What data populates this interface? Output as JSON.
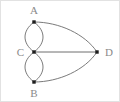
{
  "figure": {
    "kind": "multigraph-diagram",
    "width": 120,
    "height": 102,
    "background_color": "#ffffff",
    "border_color": "#e2e2e2"
  },
  "style": {
    "edge_color": "#6b6b6b",
    "vertex_color": "#1d1d1d",
    "label_color": "#8a8a8a",
    "edge_width": 0.9,
    "vertex_size": 3
  },
  "vertices": [
    {
      "id": "A",
      "label": "A",
      "x": 33,
      "y": 21,
      "label_x": 33,
      "label_y": 13,
      "label_pos": "above"
    },
    {
      "id": "C",
      "label": "C",
      "x": 33,
      "y": 51,
      "label_x": 23,
      "label_y": 55,
      "label_pos": "left"
    },
    {
      "id": "B",
      "label": "B",
      "x": 33,
      "y": 81,
      "label_x": 33,
      "label_y": 96,
      "label_pos": "below"
    },
    {
      "id": "D",
      "label": "D",
      "x": 96,
      "y": 51,
      "label_x": 104,
      "label_y": 55,
      "label_pos": "right"
    }
  ],
  "edges": [
    {
      "id": "A-C-left",
      "from": "A",
      "to": "C",
      "shape": "curve",
      "bulge": "left",
      "path": "M 33 21 C 21 30, 21 42, 33 51"
    },
    {
      "id": "A-C-right",
      "from": "A",
      "to": "C",
      "shape": "curve",
      "bulge": "right",
      "path": "M 33 21 C 45 30, 45 42, 33 51"
    },
    {
      "id": "C-B-left",
      "from": "C",
      "to": "B",
      "shape": "curve",
      "bulge": "left",
      "path": "M 33 51 C 21 60, 21 72, 33 81"
    },
    {
      "id": "C-B-right",
      "from": "C",
      "to": "B",
      "shape": "curve",
      "bulge": "right",
      "path": "M 33 51 C 45 60, 45 72, 33 81"
    },
    {
      "id": "C-D",
      "from": "C",
      "to": "D",
      "shape": "straight",
      "path": "M 33 51 L 96 51"
    },
    {
      "id": "A-D",
      "from": "A",
      "to": "D",
      "shape": "curve",
      "bulge": "up",
      "path": "M 33 21 C 58 21, 84 33, 96 51"
    },
    {
      "id": "B-D",
      "from": "B",
      "to": "D",
      "shape": "curve",
      "bulge": "down",
      "path": "M 33 81 C 58 81, 84 69, 96 51"
    }
  ],
  "summary": {
    "vertex_count": 4,
    "edge_count": 7,
    "multi_edge_pairs": [
      "A-C",
      "C-B"
    ]
  }
}
